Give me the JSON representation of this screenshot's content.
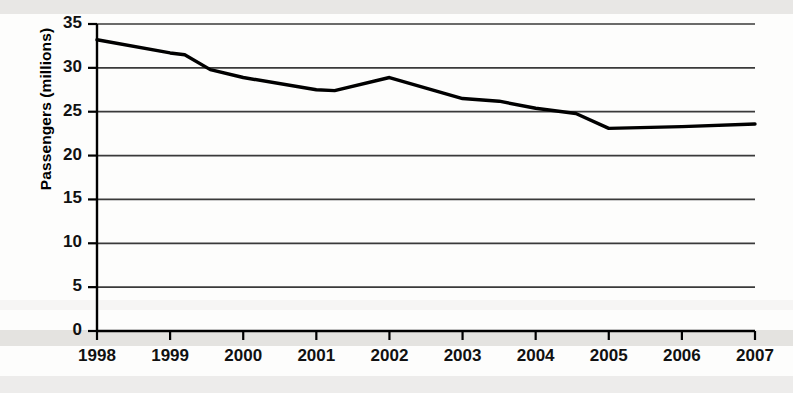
{
  "chart_data": {
    "type": "line",
    "title": "",
    "subtitle": "",
    "xlabel": "",
    "ylabel": "Passengers (millions)",
    "x": [
      1998,
      1999,
      2000,
      2001,
      2002,
      2003,
      2004,
      2005,
      2006,
      2007
    ],
    "categories": [
      "1998",
      "1999",
      "2000",
      "2001",
      "2002",
      "2003",
      "2004",
      "2005",
      "2006",
      "2007"
    ],
    "values": [
      33.2,
      31.7,
      28.9,
      27.5,
      28.9,
      26.5,
      25.4,
      23.1,
      23.4,
      23.6
    ],
    "series": [
      {
        "name": "Passengers",
        "values": [
          33.2,
          31.7,
          28.9,
          27.5,
          28.9,
          26.5,
          25.4,
          23.1,
          23.4,
          23.6
        ]
      }
    ],
    "vertices": [
      {
        "x": 1998.0,
        "y": 33.2
      },
      {
        "x": 1999.0,
        "y": 31.7
      },
      {
        "x": 1999.2,
        "y": 31.5
      },
      {
        "x": 1999.55,
        "y": 29.8
      },
      {
        "x": 2000.0,
        "y": 28.9
      },
      {
        "x": 2001.0,
        "y": 27.5
      },
      {
        "x": 2001.25,
        "y": 27.4
      },
      {
        "x": 2002.0,
        "y": 28.9
      },
      {
        "x": 2003.0,
        "y": 26.5
      },
      {
        "x": 2003.5,
        "y": 26.2
      },
      {
        "x": 2004.0,
        "y": 25.4
      },
      {
        "x": 2004.55,
        "y": 24.8
      },
      {
        "x": 2005.0,
        "y": 23.1
      },
      {
        "x": 2006.0,
        "y": 23.3
      },
      {
        "x": 2007.0,
        "y": 23.6
      }
    ],
    "ylim": [
      0,
      35
    ],
    "yticks": [
      0,
      5,
      10,
      15,
      20,
      25,
      30,
      35
    ],
    "ytick_labels": [
      "0",
      "5",
      "10",
      "15",
      "20",
      "25",
      "30",
      "35"
    ],
    "xlim": [
      1998,
      2007
    ],
    "xticks": [
      1998,
      1999,
      2000,
      2001,
      2002,
      2003,
      2004,
      2005,
      2006,
      2007
    ],
    "grid": "horizontal",
    "legend": "none",
    "line_color": "#000000",
    "grid_color": "#3a3a3a",
    "axis_color": "#000000",
    "background_color": "#ffffff",
    "annotations": []
  }
}
